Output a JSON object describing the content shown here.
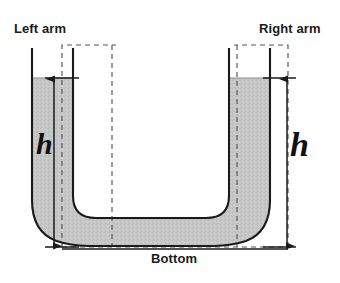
{
  "figure": {
    "type": "u-tube-manometer-diagram",
    "labels": {
      "left_arm": "Left arm",
      "right_arm": "Right arm",
      "bottom": "Bottom",
      "height_left": "h",
      "height_right": "h"
    },
    "colors": {
      "liquid_fill": "#c6c6c6",
      "outline": "#1a1a1a",
      "dashed_guide": "#555555",
      "background": "#ffffff",
      "text": "#1a1a1a"
    },
    "geometry": {
      "left_arm_region": {
        "x": 62,
        "y": 45,
        "width": 54,
        "height": 202
      },
      "right_arm_region": {
        "x": 232,
        "y": 45,
        "width": 56,
        "height": 202
      },
      "liquid_surface_y": 78,
      "tube_bottom_y": 247,
      "dimension_left_x": 54,
      "dimension_right_x": 287
    },
    "annotations": {
      "dimension_left": {
        "label": "h",
        "from_y": 78,
        "to_y": 247
      },
      "dimension_right": {
        "label": "h",
        "from_y": 78,
        "to_y": 247
      }
    }
  }
}
